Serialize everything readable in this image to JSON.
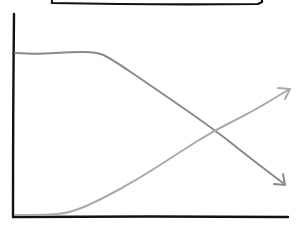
{
  "diagram": {
    "type": "hand-drawn crossing trend lines",
    "colors": {
      "axis": "#111111",
      "frame": "#111111",
      "declining_line": "#8a8a8a",
      "rising_line": "#aaaaaa",
      "background": "#ffffff"
    },
    "axes": {
      "y_axis": {
        "x": 13,
        "y1": 14,
        "y2": 217
      },
      "x_axis": {
        "y": 217,
        "x1": 13,
        "x2": 288
      }
    },
    "lines": [
      {
        "name": "declining-line",
        "description": "Starts high, flat plateau, then declines with arrowhead at bottom right",
        "points": [
          [
            15,
            53
          ],
          [
            40,
            54
          ],
          [
            70,
            52
          ],
          [
            97,
            52
          ],
          [
            110,
            58
          ],
          [
            150,
            85
          ],
          [
            215,
            130
          ],
          [
            250,
            158
          ],
          [
            283,
            183
          ]
        ],
        "arrow_end": [
          285,
          185
        ]
      },
      {
        "name": "rising-line",
        "description": "Starts at bottom, flat, then rises with arrowhead at top right",
        "points": [
          [
            15,
            215
          ],
          [
            45,
            215
          ],
          [
            70,
            213
          ],
          [
            100,
            200
          ],
          [
            140,
            178
          ],
          [
            180,
            152
          ],
          [
            215,
            130
          ],
          [
            250,
            113
          ],
          [
            288,
            90
          ]
        ],
        "arrow_end": [
          290,
          89
        ]
      }
    ],
    "crossing_point": [
      215,
      130
    ],
    "top_frame_edge": {
      "x1": 52,
      "x2": 262,
      "y": 2
    }
  }
}
